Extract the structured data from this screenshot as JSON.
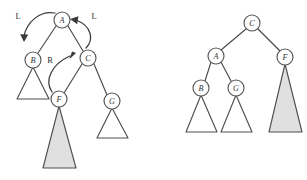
{
  "figure": {
    "background_color": "#ffffff",
    "stroke_color": "#4a4a4a",
    "node_fill": "#ffffff",
    "subtree_white_fill": "#ffffff",
    "subtree_gray_fill": "#e0e0e0"
  },
  "left_tree": {
    "name": "before-rotation-tree",
    "nodes": [
      {
        "id": "A",
        "label": "A",
        "cx": 62,
        "cy": 20,
        "r": 8.0
      },
      {
        "id": "B",
        "label": "B",
        "cx": 33,
        "cy": 60,
        "r": 8.0
      },
      {
        "id": "C",
        "label": "C",
        "cx": 88,
        "cy": 58,
        "r": 8.0
      },
      {
        "id": "F",
        "label": "F",
        "cx": 59,
        "cy": 99,
        "r": 8.0
      },
      {
        "id": "G",
        "label": "G",
        "cx": 112,
        "cy": 101,
        "r": 8.0
      }
    ],
    "edges": [
      {
        "from": "A",
        "to": "B",
        "x1": 56,
        "y1": 26,
        "x2": 38,
        "y2": 53
      },
      {
        "from": "A",
        "to": "C",
        "x1": 68,
        "y1": 26,
        "x2": 83,
        "y2": 51
      },
      {
        "from": "C",
        "to": "F",
        "x1": 82,
        "y1": 64,
        "x2": 64,
        "y2": 93
      },
      {
        "from": "C",
        "to": "G",
        "x1": 94,
        "y1": 64,
        "x2": 107,
        "y2": 95
      }
    ],
    "subtrees": [
      {
        "parent": "B",
        "fill": "white",
        "apex_x": 33,
        "apex_y": 67,
        "left_x": 17,
        "right_x": 49,
        "base_y": 99
      },
      {
        "parent": "F",
        "fill": "gray",
        "apex_x": 59,
        "apex_y": 106,
        "left_x": 43,
        "right_x": 76,
        "base_y": 168
      },
      {
        "parent": "G",
        "fill": "white",
        "apex_x": 112,
        "apex_y": 108,
        "left_x": 97,
        "right_x": 128,
        "base_y": 138
      }
    ]
  },
  "right_tree": {
    "name": "after-rotation-tree",
    "nodes": [
      {
        "id": "C",
        "label": "C",
        "cx": 252,
        "cy": 23,
        "r": 8.0
      },
      {
        "id": "A",
        "label": "A",
        "cx": 216,
        "cy": 56,
        "r": 8.0
      },
      {
        "id": "F",
        "label": "F",
        "cx": 285,
        "cy": 57,
        "r": 8.0
      },
      {
        "id": "B",
        "label": "B",
        "cx": 201,
        "cy": 88,
        "r": 8.0
      },
      {
        "id": "G",
        "label": "G",
        "cx": 236,
        "cy": 88,
        "r": 8.0
      }
    ],
    "edges": [
      {
        "from": "C",
        "to": "A",
        "x1": 246,
        "y1": 29,
        "x2": 221,
        "y2": 50
      },
      {
        "from": "C",
        "to": "F",
        "x1": 258,
        "y1": 29,
        "x2": 280,
        "y2": 51
      },
      {
        "from": "A",
        "to": "B",
        "x1": 211,
        "y1": 62,
        "x2": 205,
        "y2": 81
      },
      {
        "from": "A",
        "to": "G",
        "x1": 221,
        "y1": 62,
        "x2": 231,
        "y2": 81
      }
    ],
    "subtrees": [
      {
        "parent": "B",
        "fill": "white",
        "apex_x": 201,
        "apex_y": 95,
        "left_x": 186,
        "right_x": 217,
        "base_y": 132
      },
      {
        "parent": "G",
        "fill": "white",
        "apex_x": 236,
        "apex_y": 95,
        "left_x": 221,
        "right_x": 252,
        "base_y": 132
      },
      {
        "parent": "F",
        "fill": "gray",
        "apex_x": 285,
        "apex_y": 64,
        "left_x": 269,
        "right_x": 302,
        "base_y": 132
      }
    ]
  },
  "annotations": [
    {
      "id": "rotation-left-outer",
      "label": "L",
      "x": 18,
      "y": 16
    },
    {
      "id": "rotation-left-inner",
      "label": "L",
      "x": 94,
      "y": 16
    },
    {
      "id": "rotation-right",
      "label": "R",
      "x": 50,
      "y": 60
    }
  ],
  "arrows": [
    {
      "id": "arrow-a-to-b",
      "label": "L",
      "path": "M 55 13 C 40 10 27 22 24 36",
      "head": "M 24 42 L 20.2 34.2 L 28.2 34.6 Z"
    },
    {
      "id": "arrow-c-to-a",
      "label": "L",
      "path": "M 86 48 C 94 40 92 26 76 20",
      "head": "M 70 19 L 78.4 16.2 L 77.2 24.2 Z"
    },
    {
      "id": "arrow-f-to-c",
      "label": "R",
      "path": "M 52 92 C 44 80 52 64 70 56",
      "head": "M 76 53 L 69.4 59.2 L 72.0 51.6 Z"
    }
  ]
}
